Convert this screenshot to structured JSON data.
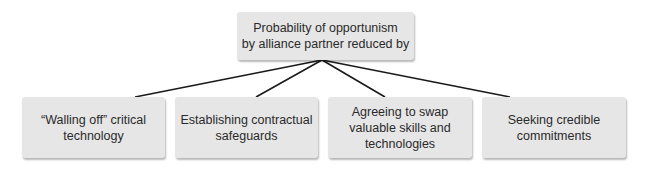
{
  "diagram": {
    "root": {
      "label_line1": "Probability of opportunism",
      "label_line2": "by alliance partner reduced by"
    },
    "children": [
      {
        "label_line1": "“Walling off” critical",
        "label_line2": "technology",
        "label_line3": ""
      },
      {
        "label_line1": "Establishing contractual",
        "label_line2": "safeguards",
        "label_line3": ""
      },
      {
        "label_line1": "Agreeing to swap",
        "label_line2": "valuable skills and",
        "label_line3": "technologies"
      },
      {
        "label_line1": "Seeking credible",
        "label_line2": "commitments",
        "label_line3": ""
      }
    ],
    "colors": {
      "box_fill": "#e6e6e6",
      "line": "#1a1a1a",
      "text": "#2a2a2a"
    }
  }
}
